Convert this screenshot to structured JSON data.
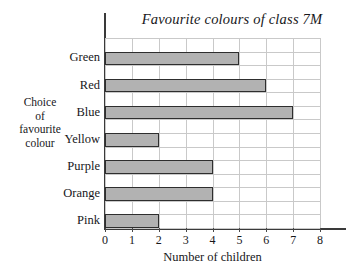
{
  "chart_data": {
    "type": "bar",
    "orientation": "horizontal",
    "title": "Favourite colours of class 7M",
    "xlabel": "Number of children",
    "ylabel_lines": [
      "Choice",
      "of",
      "favourite",
      "colour"
    ],
    "ylabel": "Choice of favourite colour",
    "categories": [
      "Green",
      "Red",
      "Blue",
      "Yellow",
      "Purple",
      "Orange",
      "Pink"
    ],
    "values": [
      5,
      6,
      7,
      2,
      4,
      4,
      2
    ],
    "xlim": [
      0,
      8
    ],
    "xticks": [
      0,
      1,
      2,
      3,
      4,
      5,
      6,
      7,
      8
    ],
    "xtick_labels": [
      "0",
      "1",
      "2",
      "3",
      "4",
      "5",
      "6",
      "7",
      "8"
    ],
    "grid": true,
    "legend": null,
    "bar_fill_color": "#b2b2b2",
    "bar_border_color": "#2e2e2e",
    "grid_color": "#c9c9c9",
    "axis_color": "#3a3a3a",
    "background_color": "#ffffff"
  }
}
